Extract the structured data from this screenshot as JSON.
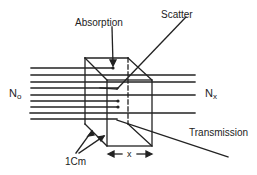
{
  "diagram": {
    "type": "beam attenuation through sample cube",
    "labels": {
      "absorption": "Absorption",
      "scatter": "Scatter",
      "transmission": "Transmission",
      "incident": "N",
      "incident_sub": "o",
      "exiting": "N",
      "exiting_sub": "x",
      "cube_size": "1Cm",
      "path_length": "x"
    },
    "colors": {
      "line": "#222222",
      "background": "#ffffff"
    }
  }
}
